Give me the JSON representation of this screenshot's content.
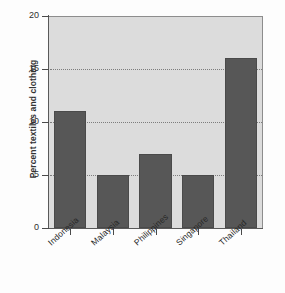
{
  "chart_data": {
    "type": "bar",
    "title": "",
    "subtitle": "",
    "xlabel": "",
    "ylabel": "Percent textiles and clothing",
    "categories": [
      "Indonesia",
      "Malaysia",
      "Philippines",
      "Singapore",
      "Thailand"
    ],
    "values": [
      11,
      5,
      7,
      5,
      16
    ],
    "ylim": [
      0,
      20
    ],
    "yticks": [
      0,
      5,
      10,
      15,
      20
    ],
    "ytick_labels": [
      "0",
      "5",
      "10",
      "15",
      "20"
    ],
    "grid": "horizontal-dotted",
    "legend": "none",
    "colors": {
      "bar": "#575757",
      "bar_edge": "#4a4a4a",
      "plot_background": "#dcdcdc",
      "figure_background": "#fdfdfd",
      "axis": "#595959",
      "gridline": "#7d7d7d",
      "text": "#262626"
    }
  },
  "axes": {
    "y_title": "Percent textiles and clothing",
    "ticks": [
      {
        "label": "20",
        "value": 20
      },
      {
        "label": "15",
        "value": 15
      },
      {
        "label": "10",
        "value": 10
      },
      {
        "label": "5",
        "value": 5
      },
      {
        "label": "0",
        "value": 0
      }
    ]
  },
  "bars": [
    {
      "label": "Indonesia",
      "value": 11
    },
    {
      "label": "Malaysia",
      "value": 5
    },
    {
      "label": "Philippines",
      "value": 7
    },
    {
      "label": "Singapore",
      "value": 5
    },
    {
      "label": "Thailand",
      "value": 16
    }
  ]
}
